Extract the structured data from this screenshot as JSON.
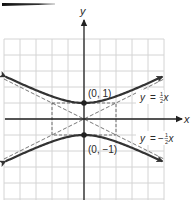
{
  "figure": {
    "type": "hyperbola-graph",
    "equation_description": "y^2 - x^2/4 = 1",
    "axis_labels": {
      "x": "x",
      "y": "y"
    },
    "points": [
      {
        "label": "(0, 1)",
        "x": 0,
        "y": 1
      },
      {
        "label": "(0, −1)",
        "x": 0,
        "y": -1
      }
    ],
    "asymptotes": [
      {
        "label_lhs": "y",
        "label_eq": "=",
        "label_sign": "",
        "label_num": "1",
        "label_den": "2",
        "label_var": "x",
        "slope": 0.5
      },
      {
        "label_lhs": "y",
        "label_eq": "=",
        "label_sign": "−",
        "label_num": "1",
        "label_den": "2",
        "label_var": "x",
        "slope": -0.5
      }
    ],
    "grid": {
      "x_min": -5,
      "x_max": 5,
      "y_min": -5,
      "y_max": 5,
      "unit_px": 16
    },
    "colors": {
      "curve": "#333333",
      "axis": "#222222",
      "grid": "#d4d4d4",
      "dashed": "#555555",
      "header_bar": "#1a1a1a"
    }
  }
}
